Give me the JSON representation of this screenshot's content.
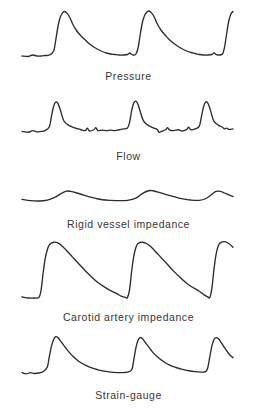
{
  "figure": {
    "background_color": "#ffffff",
    "trace_color": "#2e2b2a",
    "label_color": "#3a3634",
    "panel_count": 5
  },
  "panels": [
    {
      "id": "pressure",
      "label": "Pressure"
    },
    {
      "id": "flow",
      "label": "Flow"
    },
    {
      "id": "rigid",
      "label": "Rigid vessel impedance"
    },
    {
      "id": "carotid",
      "label": "Carotid artery impedance"
    },
    {
      "id": "strain",
      "label": "Strain-gauge"
    }
  ],
  "chart_data": {
    "type": "line",
    "title": "",
    "xlabel": "",
    "ylabel": "",
    "grid": false,
    "legend": "none",
    "axis_visible": false,
    "tick_labels": [],
    "x_range": [
      0,
      100
    ],
    "y_range": [
      0,
      1
    ],
    "cycles": 3,
    "series": [
      {
        "name": "Pressure",
        "amplitude": 1.0,
        "baseline": 0.1,
        "waveform": "sharp upstroke, narrow rounded peak, exponential decay with dicrotic step to flat baseline",
        "points": [
          [
            0,
            0.1
          ],
          [
            3,
            0.09
          ],
          [
            5,
            0.12
          ],
          [
            7,
            0.1
          ],
          [
            9,
            0.1
          ],
          [
            11,
            0.11
          ],
          [
            13,
            0.12
          ],
          [
            15,
            0.2
          ],
          [
            16,
            0.42
          ],
          [
            17,
            0.68
          ],
          [
            18,
            0.86
          ],
          [
            19,
            0.95
          ],
          [
            20,
            0.99
          ],
          [
            21,
            0.97
          ],
          [
            22,
            0.92
          ],
          [
            23,
            0.84
          ],
          [
            24,
            0.74
          ],
          [
            26,
            0.6
          ],
          [
            28,
            0.5
          ],
          [
            30,
            0.42
          ],
          [
            32,
            0.34
          ],
          [
            34,
            0.28
          ],
          [
            36,
            0.23
          ],
          [
            38,
            0.19
          ],
          [
            40,
            0.16
          ],
          [
            42,
            0.14
          ],
          [
            44,
            0.13
          ],
          [
            46,
            0.12
          ],
          [
            48,
            0.12
          ],
          [
            50,
            0.13
          ],
          [
            51,
            0.16
          ],
          [
            52,
            0.13
          ],
          [
            53,
            0.12
          ],
          [
            54,
            0.14
          ],
          [
            55,
            0.26
          ],
          [
            56,
            0.52
          ],
          [
            57,
            0.76
          ],
          [
            58,
            0.9
          ],
          [
            59,
            0.97
          ],
          [
            60,
            1.0
          ],
          [
            61,
            0.98
          ],
          [
            62,
            0.93
          ],
          [
            63,
            0.85
          ],
          [
            64,
            0.75
          ],
          [
            66,
            0.61
          ],
          [
            68,
            0.51
          ],
          [
            70,
            0.42
          ],
          [
            72,
            0.35
          ],
          [
            74,
            0.29
          ],
          [
            76,
            0.24
          ],
          [
            78,
            0.2
          ],
          [
            80,
            0.17
          ],
          [
            82,
            0.15
          ],
          [
            84,
            0.13
          ],
          [
            86,
            0.12
          ],
          [
            88,
            0.12
          ],
          [
            90,
            0.13
          ],
          [
            91,
            0.16
          ],
          [
            92,
            0.13
          ],
          [
            93,
            0.12
          ],
          [
            95,
            0.14
          ],
          [
            96,
            0.28
          ],
          [
            97,
            0.55
          ],
          [
            98,
            0.8
          ],
          [
            99,
            0.94
          ],
          [
            100,
            0.99
          ]
        ]
      },
      {
        "name": "Flow",
        "amplitude": 0.85,
        "baseline": 0.18,
        "waveform": "narrow tall spike with rapid fall and small ripples along the baseline",
        "points": [
          [
            0,
            0.18
          ],
          [
            3,
            0.16
          ],
          [
            5,
            0.2
          ],
          [
            7,
            0.17
          ],
          [
            9,
            0.18
          ],
          [
            11,
            0.2
          ],
          [
            13,
            0.3
          ],
          [
            14,
            0.55
          ],
          [
            15,
            0.78
          ],
          [
            16,
            0.88
          ],
          [
            17,
            0.85
          ],
          [
            18,
            0.72
          ],
          [
            19,
            0.55
          ],
          [
            20,
            0.42
          ],
          [
            22,
            0.33
          ],
          [
            24,
            0.28
          ],
          [
            26,
            0.25
          ],
          [
            28,
            0.22
          ],
          [
            30,
            0.2
          ],
          [
            31,
            0.26
          ],
          [
            32,
            0.19
          ],
          [
            34,
            0.22
          ],
          [
            35,
            0.27
          ],
          [
            36,
            0.2
          ],
          [
            38,
            0.21
          ],
          [
            40,
            0.2
          ],
          [
            42,
            0.21
          ],
          [
            44,
            0.2
          ],
          [
            46,
            0.22
          ],
          [
            48,
            0.24
          ],
          [
            50,
            0.26
          ],
          [
            51,
            0.4
          ],
          [
            52,
            0.68
          ],
          [
            53,
            0.86
          ],
          [
            54,
            0.9
          ],
          [
            55,
            0.82
          ],
          [
            56,
            0.66
          ],
          [
            57,
            0.5
          ],
          [
            58,
            0.4
          ],
          [
            60,
            0.32
          ],
          [
            62,
            0.27
          ],
          [
            64,
            0.23
          ],
          [
            65,
            0.16
          ],
          [
            66,
            0.18
          ],
          [
            68,
            0.22
          ],
          [
            69,
            0.27
          ],
          [
            70,
            0.21
          ],
          [
            72,
            0.2
          ],
          [
            74,
            0.22
          ],
          [
            76,
            0.19
          ],
          [
            78,
            0.23
          ],
          [
            79,
            0.28
          ],
          [
            80,
            0.22
          ],
          [
            82,
            0.24
          ],
          [
            84,
            0.3
          ],
          [
            85,
            0.52
          ],
          [
            86,
            0.76
          ],
          [
            87,
            0.88
          ],
          [
            88,
            0.86
          ],
          [
            89,
            0.74
          ],
          [
            90,
            0.56
          ],
          [
            91,
            0.42
          ],
          [
            93,
            0.33
          ],
          [
            95,
            0.28
          ],
          [
            96,
            0.24
          ],
          [
            97,
            0.26
          ],
          [
            98,
            0.23
          ],
          [
            100,
            0.24
          ]
        ]
      },
      {
        "name": "Rigid vessel impedance",
        "amplitude": 0.35,
        "baseline": 0.28,
        "waveform": "low amplitude rolling undulation, shallow rounded humps",
        "points": [
          [
            0,
            0.3
          ],
          [
            4,
            0.26
          ],
          [
            8,
            0.25
          ],
          [
            12,
            0.28
          ],
          [
            16,
            0.38
          ],
          [
            19,
            0.5
          ],
          [
            21,
            0.56
          ],
          [
            23,
            0.55
          ],
          [
            26,
            0.5
          ],
          [
            29,
            0.44
          ],
          [
            32,
            0.38
          ],
          [
            35,
            0.33
          ],
          [
            38,
            0.29
          ],
          [
            42,
            0.27
          ],
          [
            46,
            0.26
          ],
          [
            50,
            0.27
          ],
          [
            54,
            0.34
          ],
          [
            57,
            0.48
          ],
          [
            60,
            0.57
          ],
          [
            62,
            0.57
          ],
          [
            65,
            0.52
          ],
          [
            68,
            0.46
          ],
          [
            71,
            0.4
          ],
          [
            74,
            0.35
          ],
          [
            77,
            0.31
          ],
          [
            80,
            0.28
          ],
          [
            84,
            0.27
          ],
          [
            87,
            0.32
          ],
          [
            90,
            0.46
          ],
          [
            92,
            0.55
          ],
          [
            94,
            0.55
          ],
          [
            96,
            0.5
          ],
          [
            98,
            0.44
          ],
          [
            100,
            0.39
          ]
        ]
      },
      {
        "name": "Carotid artery impedance",
        "amplitude": 1.0,
        "baseline": 0.08,
        "waveform": "near vertical upstroke, broad rounded dome, slow concave decay to flat foot",
        "points": [
          [
            0,
            0.1
          ],
          [
            3,
            0.08
          ],
          [
            6,
            0.08
          ],
          [
            8,
            0.09
          ],
          [
            9,
            0.2
          ],
          [
            10,
            0.48
          ],
          [
            11,
            0.72
          ],
          [
            12,
            0.86
          ],
          [
            13,
            0.94
          ],
          [
            15,
            0.98
          ],
          [
            17,
            0.97
          ],
          [
            19,
            0.92
          ],
          [
            21,
            0.85
          ],
          [
            24,
            0.74
          ],
          [
            27,
            0.63
          ],
          [
            30,
            0.52
          ],
          [
            33,
            0.42
          ],
          [
            36,
            0.33
          ],
          [
            39,
            0.26
          ],
          [
            42,
            0.2
          ],
          [
            45,
            0.15
          ],
          [
            47,
            0.11
          ],
          [
            49,
            0.09
          ],
          [
            50,
            0.09
          ],
          [
            51,
            0.22
          ],
          [
            52,
            0.52
          ],
          [
            53,
            0.76
          ],
          [
            54,
            0.9
          ],
          [
            55,
            0.96
          ],
          [
            57,
            0.98
          ],
          [
            59,
            0.96
          ],
          [
            61,
            0.91
          ],
          [
            63,
            0.84
          ],
          [
            66,
            0.73
          ],
          [
            69,
            0.62
          ],
          [
            72,
            0.51
          ],
          [
            75,
            0.41
          ],
          [
            78,
            0.32
          ],
          [
            81,
            0.25
          ],
          [
            84,
            0.19
          ],
          [
            86,
            0.14
          ],
          [
            88,
            0.1
          ],
          [
            89,
            0.09
          ],
          [
            90,
            0.24
          ],
          [
            91,
            0.55
          ],
          [
            92,
            0.79
          ],
          [
            93,
            0.92
          ],
          [
            94,
            0.97
          ],
          [
            96,
            0.99
          ],
          [
            98,
            0.96
          ],
          [
            100,
            0.9
          ]
        ]
      },
      {
        "name": "Strain-gauge",
        "amplitude": 0.95,
        "baseline": 0.12,
        "waveform": "steep upstroke to a narrow peak then smooth decay to a long flat baseline",
        "points": [
          [
            0,
            0.14
          ],
          [
            2,
            0.11
          ],
          [
            4,
            0.14
          ],
          [
            6,
            0.12
          ],
          [
            8,
            0.13
          ],
          [
            10,
            0.16
          ],
          [
            12,
            0.26
          ],
          [
            13,
            0.5
          ],
          [
            14,
            0.72
          ],
          [
            15,
            0.86
          ],
          [
            16,
            0.92
          ],
          [
            17,
            0.9
          ],
          [
            18,
            0.84
          ],
          [
            20,
            0.72
          ],
          [
            22,
            0.6
          ],
          [
            24,
            0.5
          ],
          [
            27,
            0.38
          ],
          [
            30,
            0.3
          ],
          [
            33,
            0.24
          ],
          [
            36,
            0.2
          ],
          [
            39,
            0.17
          ],
          [
            42,
            0.15
          ],
          [
            45,
            0.14
          ],
          [
            48,
            0.14
          ],
          [
            50,
            0.15
          ],
          [
            52,
            0.2
          ],
          [
            53,
            0.42
          ],
          [
            54,
            0.68
          ],
          [
            55,
            0.84
          ],
          [
            56,
            0.9
          ],
          [
            57,
            0.88
          ],
          [
            58,
            0.82
          ],
          [
            60,
            0.7
          ],
          [
            62,
            0.58
          ],
          [
            64,
            0.49
          ],
          [
            67,
            0.38
          ],
          [
            70,
            0.3
          ],
          [
            73,
            0.25
          ],
          [
            76,
            0.21
          ],
          [
            79,
            0.18
          ],
          [
            82,
            0.16
          ],
          [
            85,
            0.15
          ],
          [
            87,
            0.16
          ],
          [
            88,
            0.24
          ],
          [
            89,
            0.48
          ],
          [
            90,
            0.72
          ],
          [
            91,
            0.86
          ],
          [
            92,
            0.9
          ],
          [
            93,
            0.88
          ],
          [
            94,
            0.82
          ],
          [
            96,
            0.68
          ],
          [
            98,
            0.55
          ],
          [
            100,
            0.46
          ]
        ]
      }
    ]
  }
}
